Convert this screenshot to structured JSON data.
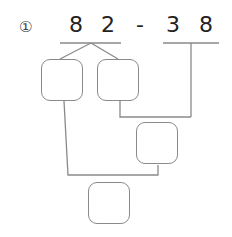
{
  "problem": {
    "index_label": "①",
    "digits_left": [
      "8",
      "2"
    ],
    "operator": "-",
    "digits_right": [
      "3",
      "8"
    ]
  },
  "boxes": [
    {
      "id": "box-1",
      "value": ""
    },
    {
      "id": "box-2",
      "value": ""
    },
    {
      "id": "box-3",
      "value": ""
    },
    {
      "id": "box-4",
      "value": ""
    }
  ],
  "colors": {
    "line": "#8a8a8a",
    "text": "#222222"
  }
}
